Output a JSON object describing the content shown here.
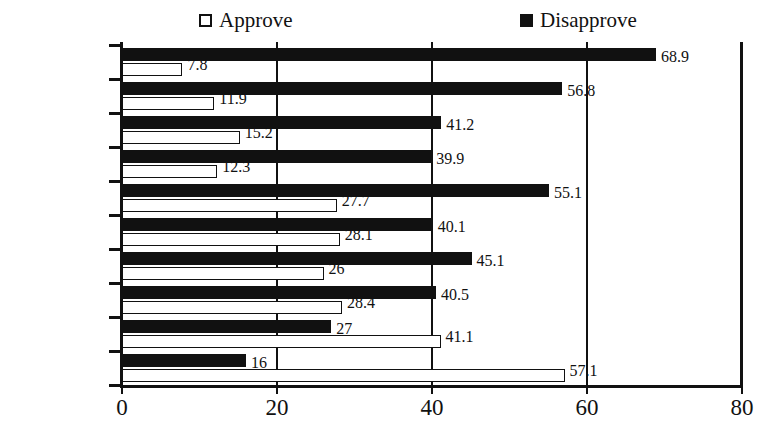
{
  "chart_data": {
    "type": "bar",
    "orientation": "horizontal",
    "title": "",
    "xlabel": "",
    "ylabel": "",
    "xlim": [
      0,
      80
    ],
    "xticks": [
      0,
      20,
      40,
      60,
      80
    ],
    "xtick_labels": [
      "0",
      "20",
      "40",
      "60",
      "80"
    ],
    "grid": true,
    "grid_axis": "x",
    "legend_position": "top",
    "legend": [
      "Approve",
      "Disapprove"
    ],
    "categories": [
      "",
      "1992 Jun",
      "",
      "1991 Jan",
      "",
      "1990 Feb",
      "",
      "1989 Apr",
      "",
      "1988 Jun"
    ],
    "visible_category_labels": [
      "1992 Jun",
      "1991 Jan",
      "1990 Feb",
      "1989 Apr",
      "1988 Jun"
    ],
    "series": [
      {
        "name": "Disapprove",
        "color": "#111111",
        "values": [
          68.9,
          56.8,
          41.2,
          39.9,
          55.1,
          40.1,
          45.1,
          40.5,
          27,
          16
        ],
        "labels": [
          "68.9",
          "56.8",
          "41.2",
          "39.9",
          "55.1",
          "40.1",
          "45.1",
          "40.5",
          "27",
          "16"
        ]
      },
      {
        "name": "Approve",
        "color": "#ffffff",
        "values": [
          7.8,
          11.9,
          15.2,
          12.3,
          27.7,
          28.1,
          26,
          28.4,
          41.1,
          57.1
        ],
        "labels": [
          "7.8",
          "11.9",
          "15.2",
          "12.3",
          "27.7",
          "28.1",
          "26",
          "28.4",
          "41.1",
          "57.1"
        ]
      }
    ]
  },
  "legend": {
    "approve_label": "Approve",
    "disapprove_label": "Disapprove"
  },
  "axis": {
    "tick_labels": [
      "0",
      "20",
      "40",
      "60",
      "80"
    ]
  },
  "categories": {
    "labels": [
      "1992 Jun",
      "1991 Jan",
      "1990 Feb",
      "1989 Apr",
      "1988 Jun"
    ]
  }
}
